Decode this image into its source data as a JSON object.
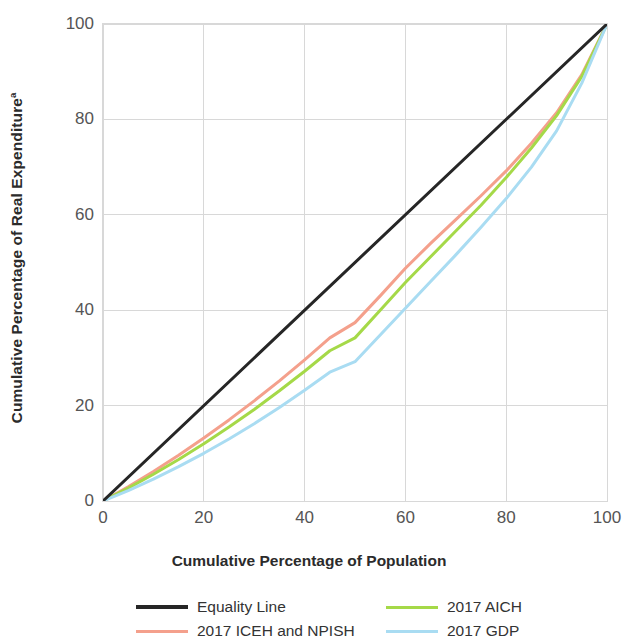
{
  "chart_data": {
    "type": "line",
    "title": "",
    "subtitle": "",
    "xlabel": "Cumulative Percentage of Population",
    "ylabel": "Cumulative Percentage of Real Expenditure",
    "ylabel_superscript": "a",
    "xlim": [
      0,
      100
    ],
    "ylim": [
      0,
      100
    ],
    "xticks": [
      0,
      20,
      40,
      60,
      80,
      100
    ],
    "yticks": [
      0,
      20,
      40,
      60,
      80,
      100
    ],
    "grid": true,
    "legend_position": "below",
    "annotations": [],
    "series": [
      {
        "name": "Equality Line",
        "color": "#262626",
        "width": 3.0,
        "x": [
          0,
          100
        ],
        "y": [
          0,
          100
        ]
      },
      {
        "name": "2017 ICEH and NPISH",
        "color": "#f4a08c",
        "width": 3.0,
        "x": [
          0,
          5,
          10,
          15,
          20,
          25,
          30,
          35,
          40,
          45,
          50,
          55,
          60,
          65,
          70,
          75,
          80,
          85,
          90,
          95,
          100
        ],
        "y": [
          0,
          3.0,
          6.2,
          9.6,
          13.2,
          17.0,
          21.0,
          25.2,
          29.6,
          34.2,
          37.4,
          43.0,
          48.8,
          54.0,
          59.0,
          64.0,
          69.2,
          75.0,
          81.4,
          89.4,
          100
        ]
      },
      {
        "name": "2017 AICH",
        "color": "#a5d948",
        "width": 3.0,
        "x": [
          0,
          5,
          10,
          15,
          20,
          25,
          30,
          35,
          40,
          45,
          50,
          55,
          60,
          65,
          70,
          75,
          80,
          85,
          90,
          95,
          100
        ],
        "y": [
          0,
          2.7,
          5.6,
          8.7,
          12.0,
          15.5,
          19.2,
          23.1,
          27.2,
          31.5,
          34.2,
          40.0,
          45.8,
          51.2,
          56.6,
          62.0,
          67.8,
          74.0,
          80.8,
          89.0,
          100
        ]
      },
      {
        "name": "2017 GDP",
        "color": "#a9dcf2",
        "width": 3.0,
        "x": [
          0,
          5,
          10,
          15,
          20,
          25,
          30,
          35,
          40,
          45,
          50,
          55,
          60,
          65,
          70,
          75,
          80,
          85,
          90,
          95,
          100
        ],
        "y": [
          0,
          2.2,
          4.6,
          7.2,
          10.0,
          13.0,
          16.2,
          19.6,
          23.2,
          27.0,
          29.2,
          34.8,
          40.4,
          46.0,
          51.6,
          57.4,
          63.4,
          70.0,
          77.6,
          87.6,
          100
        ]
      }
    ]
  },
  "axes": {
    "xticks": [
      "0",
      "20",
      "40",
      "60",
      "80",
      "100"
    ],
    "yticks": [
      "0",
      "20",
      "40",
      "60",
      "80",
      "100"
    ],
    "xlabel": "Cumulative Percentage of Population",
    "ylabel_text": "Cumulative Percentage of Real Expenditure",
    "ylabel_sup": "a"
  },
  "legend": {
    "items": [
      {
        "label": "Equality Line",
        "color": "#262626"
      },
      {
        "label": "2017 ICEH and NPISH",
        "color": "#f4a08c"
      },
      {
        "label": "2017 AICH",
        "color": "#a5d948"
      },
      {
        "label": "2017 GDP",
        "color": "#a9dcf2"
      }
    ]
  },
  "colors": {
    "grid": "#d8d8d8",
    "axis_text": "#555555",
    "label_text": "#2b2b2b",
    "background": "#ffffff"
  }
}
